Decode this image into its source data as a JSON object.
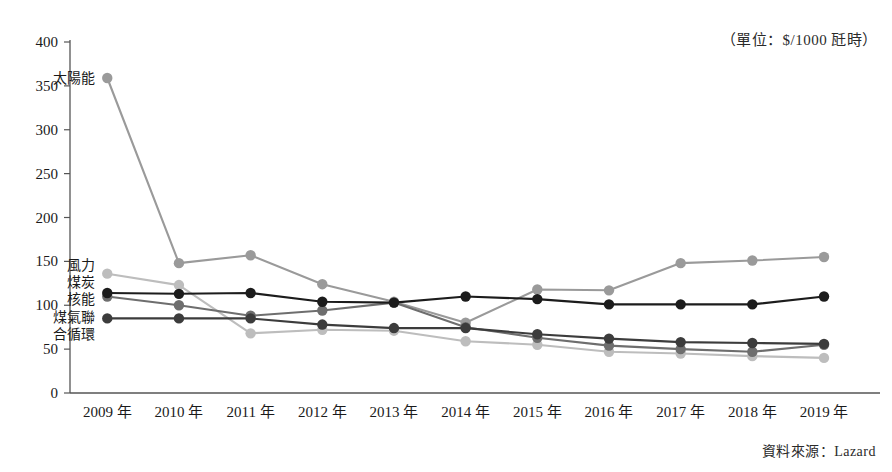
{
  "annotations": {
    "unit_note": "（單位：$/1000 瓩時）",
    "source_note": "資料來源：Lazard"
  },
  "chart_data": {
    "type": "line",
    "title": "",
    "xlabel": "",
    "ylabel": "",
    "ylim": [
      0,
      400
    ],
    "ytick_step": 50,
    "grid": false,
    "legend_position": "inline-left",
    "categories": [
      "2009 年",
      "2010 年",
      "2011 年",
      "2012 年",
      "2013 年",
      "2014 年",
      "2015 年",
      "2016 年",
      "2017 年",
      "2018 年",
      "2019 年"
    ],
    "ytick_labels": [
      "400",
      "350",
      "300",
      "250",
      "200",
      "150",
      "100",
      "50",
      "0"
    ],
    "series": [
      {
        "name": "太陽能",
        "label": "太陽能",
        "color": "#9a9a9a",
        "values": [
          359,
          148,
          157,
          124,
          104,
          80,
          118,
          117,
          148,
          151,
          155
        ]
      },
      {
        "name": "核能",
        "label": "核能",
        "color": "#1c1c1c",
        "values": [
          114,
          113,
          114,
          104,
          103,
          110,
          107,
          101,
          101,
          101,
          110
        ]
      },
      {
        "name": "煤炭",
        "label": "煤炭",
        "color": "#6e6e6e",
        "values": [
          110,
          100,
          88,
          94,
          103,
          75,
          63,
          54,
          50,
          47,
          55
        ]
      },
      {
        "name": "煤氣聯合循環",
        "label": "煤氣聯合循環",
        "color": "#3c3c3c",
        "values": [
          85,
          85,
          85,
          78,
          74,
          74,
          67,
          62,
          58,
          57,
          56
        ]
      },
      {
        "name": "風力",
        "label": "風力",
        "color": "#bdbdbd",
        "values": [
          136,
          123,
          68,
          72,
          71,
          59,
          55,
          47,
          45,
          42,
          40
        ]
      }
    ]
  }
}
